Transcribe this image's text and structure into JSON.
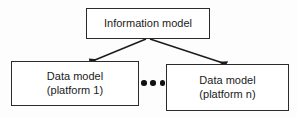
{
  "diagram": {
    "background_color": "#fdfdfd",
    "line_color": "#2b2b2b",
    "text_color": "#1a1a1a",
    "nodes": [
      {
        "id": "information-model",
        "label": "Information model",
        "shape": "rectangle"
      },
      {
        "id": "data-model-platform-1",
        "label": "Data model\n(platform 1)",
        "shape": "rectangle"
      },
      {
        "id": "data-model-platform-n",
        "label": "Data model\n(platform n)",
        "shape": "rectangle"
      }
    ],
    "edges": [
      {
        "id": "edge-to-platform-1",
        "from": "information-model",
        "to": "data-model-platform-1",
        "arrowhead": "filled-triangle"
      },
      {
        "id": "edge-to-platform-n",
        "from": "information-model",
        "to": "data-model-platform-n",
        "arrowhead": "filled-triangle"
      }
    ],
    "ellipsis": {
      "label": "•••",
      "dot_count": 3,
      "meaning": "additional platform data models"
    }
  }
}
